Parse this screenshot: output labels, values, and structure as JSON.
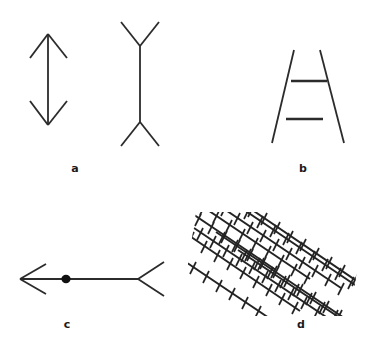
{
  "figure": {
    "background_color": "#ffffff",
    "ink_color": "#2b2b2b",
    "width": 373,
    "height": 348
  },
  "panels": [
    {
      "id": "a",
      "label": "a",
      "name": "muller-lyer-illusion",
      "label_position": {
        "x": 75,
        "y": 163
      },
      "bounds": {
        "x": 10,
        "y": 14,
        "width": 180,
        "height": 145
      },
      "figures": [
        {
          "name": "arrow-heads-inward",
          "shaft": {
            "x1": 48,
            "y1": 34,
            "x2": 48,
            "y2": 125
          },
          "fin_length": 24,
          "fin_angle_deg": 40,
          "heads": "both-ends-inward"
        },
        {
          "name": "arrow-fins-outward",
          "shaft": {
            "x1": 140,
            "y1": 46,
            "x2": 140,
            "y2": 122
          },
          "fin_length": 26,
          "fin_angle_deg": 40,
          "heads": "both-ends-outward"
        }
      ]
    },
    {
      "id": "b",
      "label": "b",
      "name": "ponzo-illusion",
      "label_position": {
        "x": 303,
        "y": 163
      },
      "bounds": {
        "x": 248,
        "y": 28,
        "width": 110,
        "height": 130
      },
      "converging_lines": [
        {
          "x1": 294,
          "y1": 50,
          "x2": 272,
          "y2": 143
        },
        {
          "x1": 320,
          "y1": 50,
          "x2": 344,
          "y2": 143
        }
      ],
      "horizontal_bars": [
        {
          "x1": 291,
          "y1": 81,
          "x2": 327,
          "y2": 81,
          "label": "upper-bar"
        },
        {
          "x1": 286,
          "y1": 119,
          "x2": 323,
          "y2": 119,
          "label": "lower-bar"
        }
      ]
    },
    {
      "id": "c",
      "label": "c",
      "name": "muller-lyer-bisection-variant",
      "label_position": {
        "x": 66,
        "y": 320
      },
      "bounds": {
        "x": 14,
        "y": 255,
        "width": 150,
        "height": 70
      },
      "shaft": {
        "x1": 20,
        "y1": 279,
        "x2": 138,
        "y2": 279
      },
      "left_head": {
        "type": "arrowhead-open-left",
        "fin_length": 27,
        "fin_angle_deg": 33
      },
      "right_head": {
        "type": "fins-open-right",
        "fin_length": 27,
        "fin_angle_deg": 33
      },
      "dot": {
        "cx": 66,
        "cy": 279,
        "r": 4.2,
        "name": "bisection-dot"
      }
    },
    {
      "id": "d",
      "label": "d",
      "name": "zollner-illusion",
      "label_position": {
        "x": 301,
        "y": 320
      },
      "bounds": {
        "x": 180,
        "y": 211,
        "width": 186,
        "height": 107
      },
      "parallel_diagonals": {
        "count": 8,
        "slope_deg": 34,
        "spacing_px": 15,
        "direction": "down-right"
      },
      "hatch_marks": {
        "angle_from_vertical_deg": 14,
        "length_px": 13,
        "spacing_along_line_px": 9
      }
    }
  ]
}
